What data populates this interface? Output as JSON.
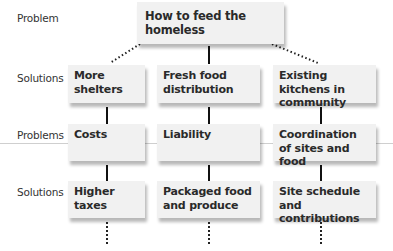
{
  "diagram": {
    "row_labels": [
      "Problem",
      "Solutions",
      "Problems",
      "Solutions"
    ],
    "root": {
      "label": "How to feed the homeless"
    },
    "columns": [
      {
        "solution": "More shelters",
        "problem": "Costs",
        "sub_solution": "Higher taxes"
      },
      {
        "solution": "Fresh food distribution",
        "problem": "Liability",
        "sub_solution": "Packaged food and produce"
      },
      {
        "solution": "Existing kitchens in community",
        "problem": "Coordination of sites and food",
        "sub_solution": "Site schedule and contributions"
      }
    ],
    "colors": {
      "box_fill": "#f1f1f1",
      "box_shadow": "#9a9a9a",
      "text": "#2a2a2a",
      "connector": "#111111"
    }
  }
}
